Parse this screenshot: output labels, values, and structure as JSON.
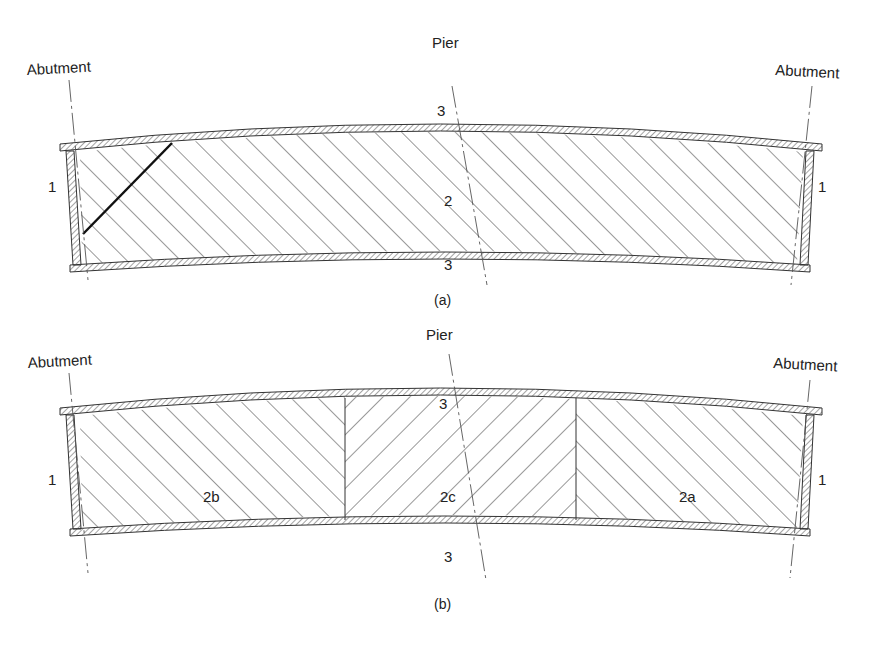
{
  "figure": {
    "panel_a": {
      "caption": "(a)",
      "labels": {
        "left_support": "Abutment",
        "right_support": "Abutment",
        "pier": "Pier",
        "left_wall_number": "1",
        "right_wall_number": "1",
        "top_flange_number": "3",
        "bottom_flange_number": "3",
        "web_number": "2"
      }
    },
    "panel_b": {
      "caption": "(b)",
      "labels": {
        "left_support": "Abutment",
        "right_support": "Abutment",
        "pier": "Pier",
        "left_wall_number": "1",
        "right_wall_number": "1",
        "top_flange_number": "3",
        "bottom_flange_number": "3",
        "web_left_number": "2b",
        "web_middle_number": "2c",
        "web_right_number": "2a"
      }
    },
    "colors": {
      "line": "#333333",
      "hatch": "#444444",
      "background": "#ffffff"
    }
  }
}
